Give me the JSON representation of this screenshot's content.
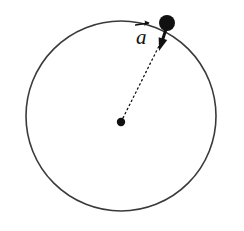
{
  "figure": {
    "type": "physics-diagram",
    "background_color": "#ffffff",
    "stroke_color": "#3a3a3a",
    "ink_color": "#111111",
    "canvas": {
      "width": 244,
      "height": 231
    },
    "circle": {
      "name": "orbit-circle",
      "center_x": 121,
      "center_y": 116,
      "radius": 95,
      "stroke_width": 1.6,
      "fill": "none",
      "style": "solid"
    },
    "center_dot": {
      "name": "center-point",
      "x": 121,
      "y": 122,
      "radius": 4.2,
      "fill": "#111111"
    },
    "particle": {
      "name": "particle",
      "x": 167,
      "y": 23,
      "radius": 8.0,
      "fill": "#111111"
    },
    "radius_line": {
      "name": "radius-dotted-line",
      "x1": 121,
      "y1": 122,
      "x2": 163,
      "y2": 38,
      "stroke_width": 1.3,
      "dash": "1.4 3.2",
      "style": "dotted"
    },
    "acceleration_vector": {
      "name": "acceleration-vector",
      "label": "a",
      "accent": "arrow",
      "tail_x": 167,
      "tail_y": 26,
      "tip_x": 159,
      "tip_y": 51,
      "stroke_width": 3.0,
      "arrowhead_length": 13,
      "arrowhead_width": 9,
      "direction": "toward-center",
      "label_x": 136,
      "label_y": 20
    }
  }
}
